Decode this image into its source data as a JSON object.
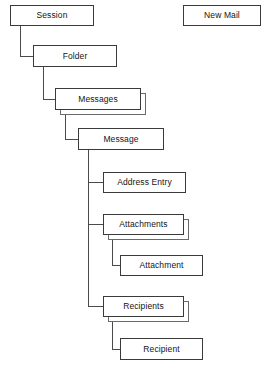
{
  "diagram": {
    "background_color": "#ffffff",
    "line_color": "#4a4a4a",
    "box_border_color": "#3a3a3a",
    "text_color": "#141414",
    "nodes": [
      {
        "id": "session",
        "label": "Session",
        "x": 10,
        "y": 5,
        "w": 84,
        "h": 21,
        "stacked": false
      },
      {
        "id": "new-mail",
        "label": "New Mail",
        "x": 183,
        "y": 5,
        "w": 78,
        "h": 21,
        "stacked": false
      },
      {
        "id": "folder",
        "label": "Folder",
        "x": 33,
        "y": 45,
        "w": 84,
        "h": 22,
        "stacked": false
      },
      {
        "id": "messages",
        "label": "Messages",
        "x": 55,
        "y": 88,
        "w": 86,
        "h": 22,
        "stacked": true
      },
      {
        "id": "message",
        "label": "Message",
        "x": 78,
        "y": 128,
        "w": 86,
        "h": 22,
        "stacked": false
      },
      {
        "id": "address-entry",
        "label": "Address Entry",
        "x": 103,
        "y": 172,
        "w": 83,
        "h": 21,
        "stacked": false
      },
      {
        "id": "attachments",
        "label": "Attachments",
        "x": 103,
        "y": 214,
        "w": 81,
        "h": 21,
        "stacked": true
      },
      {
        "id": "attachment",
        "label": "Attachment",
        "x": 120,
        "y": 255,
        "w": 83,
        "h": 21,
        "stacked": false
      },
      {
        "id": "recipients",
        "label": "Recipients",
        "x": 103,
        "y": 296,
        "w": 81,
        "h": 21,
        "stacked": true
      },
      {
        "id": "recipient",
        "label": "Recipient",
        "x": 120,
        "y": 338,
        "w": 83,
        "h": 22,
        "stacked": false
      }
    ],
    "connectors": [
      {
        "id": "session-to-folder",
        "from": "session",
        "to": "folder",
        "x": 20,
        "y1": 26,
        "y2": 56,
        "x2": 33
      },
      {
        "id": "folder-to-messages",
        "from": "folder",
        "to": "messages",
        "x": 43,
        "y1": 67,
        "y2": 99,
        "x2": 55
      },
      {
        "id": "messages-to-message",
        "from": "messages",
        "to": "message",
        "x": 65,
        "y1": 113,
        "y2": 139,
        "x2": 78
      },
      {
        "id": "message-to-address-entry",
        "from": "message",
        "to": "address-entry",
        "x": 88,
        "y1": 150,
        "y2": 182,
        "x2": 103
      },
      {
        "id": "message-to-attachments",
        "from": "message",
        "to": "attachments",
        "x": 88,
        "y1": 150,
        "y2": 224,
        "x2": 103
      },
      {
        "id": "message-to-recipients",
        "from": "message",
        "to": "recipients",
        "x": 88,
        "y1": 150,
        "y2": 306,
        "x2": 103
      },
      {
        "id": "attachments-to-attachment",
        "from": "attachments",
        "to": "attachment",
        "x": 112,
        "y1": 239,
        "y2": 265,
        "x2": 120
      },
      {
        "id": "recipients-to-recipient",
        "from": "recipients",
        "to": "recipient",
        "x": 112,
        "y1": 321,
        "y2": 349,
        "x2": 120
      }
    ]
  }
}
